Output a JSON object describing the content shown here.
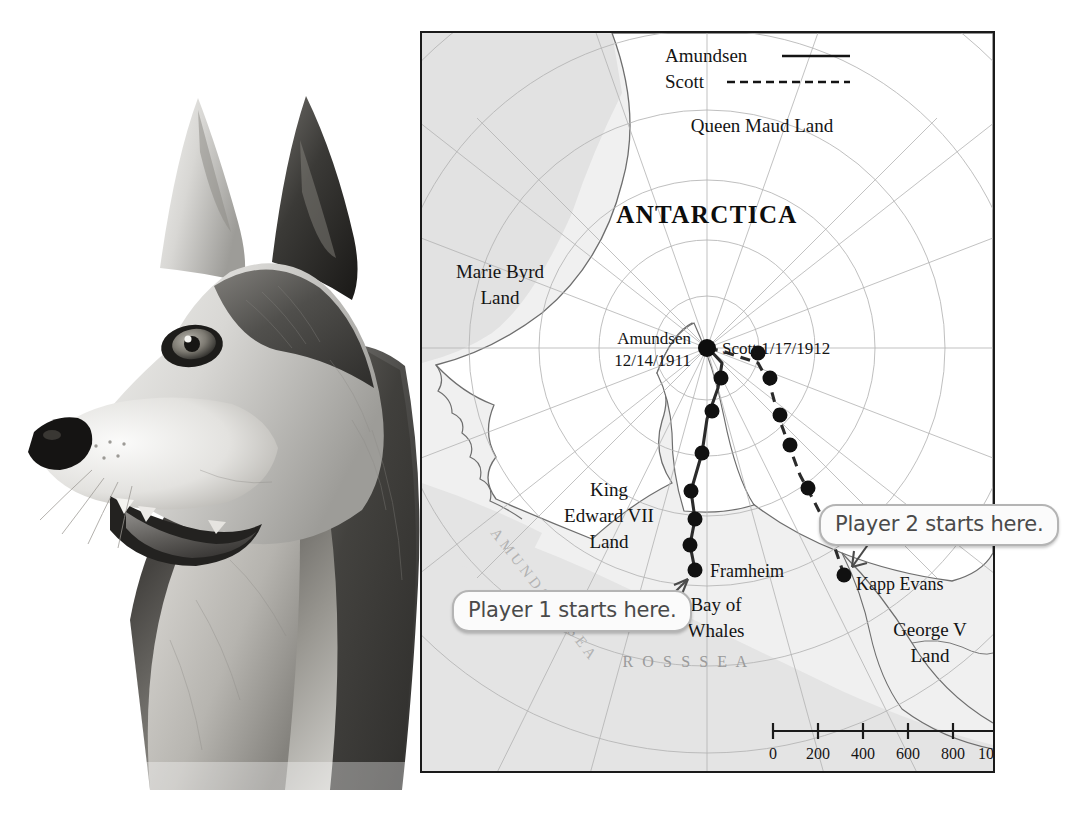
{
  "photo": {
    "subject": "sled-dog-husky-head",
    "alt": "Black and white photograph of a husky sled dog facing left"
  },
  "map": {
    "title": "ANTARCTICA",
    "legend": [
      {
        "label": "Amundsen",
        "style": "solid"
      },
      {
        "label": "Scott",
        "style": "dashed"
      }
    ],
    "regions": [
      {
        "name": "Queen Maud Land",
        "lines": [
          "Queen Maud Land"
        ]
      },
      {
        "name": "Marie Byrd Land",
        "lines": [
          "Marie Byrd",
          "Land"
        ]
      },
      {
        "name": "King Edward VII Land",
        "lines": [
          "King",
          "Edward VII",
          "Land"
        ]
      },
      {
        "name": "George V Land",
        "lines": [
          "George V",
          "Land"
        ]
      }
    ],
    "seas": [
      {
        "name": "Ross Sea",
        "label": "R O S S   S E A"
      },
      {
        "name": "Amundsen Sea",
        "label": "AMUNDSEN SEA"
      }
    ],
    "pole": {
      "amundsen_label": "Amundsen",
      "amundsen_date": "12/14/1911",
      "scott_label": "Scott 1/17/1912"
    },
    "places": [
      {
        "name": "Framheim",
        "label": "Framheim"
      },
      {
        "name": "Kapp Evans",
        "label": "Kapp Evans"
      },
      {
        "name": "Bay of Whales",
        "lines": [
          "Bay of",
          "Whales"
        ]
      }
    ],
    "scale_bar": {
      "ticks": [
        "0",
        "200",
        "400",
        "600",
        "800",
        "1000"
      ],
      "unit": "km"
    },
    "colors": {
      "frame": "#1a1a1a",
      "land_fill": "#ffffff",
      "shelf_fill": "#e4e4e4",
      "graticule": "#b0b0b0",
      "coastline": "#6e6e6e",
      "route": "#2b2b2b"
    }
  },
  "callouts": [
    {
      "id": "player-1",
      "text": "Player 1 starts here."
    },
    {
      "id": "player-2",
      "text": "Player 2 starts here."
    }
  ]
}
